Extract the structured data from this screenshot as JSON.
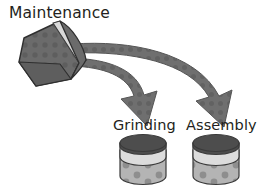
{
  "diagram": {
    "title_label": "Maintenance",
    "nodes": [
      {
        "id": "maintenance",
        "label": "Maintenance",
        "shape": "tilted-cylinder"
      },
      {
        "id": "grinding",
        "label": "Grinding",
        "shape": "cylinder-bin"
      },
      {
        "id": "assembly",
        "label": "Assembly",
        "shape": "cylinder-bin"
      }
    ],
    "edges": [
      {
        "from": "maintenance",
        "to": "grinding",
        "style": "curved-tapered-arrow"
      },
      {
        "from": "maintenance",
        "to": "assembly",
        "style": "curved-tapered-arrow"
      }
    ],
    "colors": {
      "background": "#ffffff",
      "text": "#231f20",
      "arrow_fill": "#6f6f6f",
      "arrow_stroke": "#4f4f4f",
      "source_body": "#6b6b6b",
      "source_body_dark": "#5a5a5a",
      "source_stripe": "#d9d9d9",
      "source_stroke": "#2f2f2f",
      "bin_top": "#4d4d4d",
      "bin_band": "#dcdcdc",
      "bin_body": "#b4b4b4",
      "bin_speck": "#8e8e8e",
      "bin_stroke": "#3a3a3a"
    }
  }
}
